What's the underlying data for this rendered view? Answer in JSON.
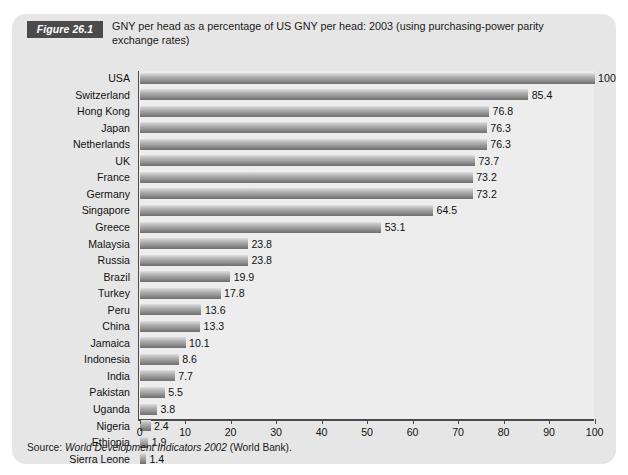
{
  "figure": {
    "tag": "Figure 26.1",
    "title": "GNY per head as  a percentage of US GNY per head: 2003 (using purchasing-power parity exchange rates)",
    "source_prefix": "Source: ",
    "source_italic": "World Development Indicators 2002",
    "source_suffix": " (World Bank)."
  },
  "colors": {
    "panel_background": "#e6e6e6",
    "plot_background": "#ededed",
    "tag_background": "#4b4b4b",
    "tag_text": "#ffffff",
    "axis": "#4a4a4a",
    "bar_light": "#e2e2e2",
    "bar_dark": "#6f6f6f",
    "text": "#111111",
    "page_background": "#ffffff"
  },
  "chart_data": {
    "type": "bar",
    "orientation": "horizontal",
    "title": "GNY per head as  a percentage of US GNY per head: 2003 (using purchasing-power parity exchange rates)",
    "xlabel": "",
    "ylabel": "",
    "xlim": [
      0,
      100
    ],
    "xticks": [
      0,
      10,
      20,
      30,
      40,
      50,
      60,
      70,
      80,
      90,
      100
    ],
    "grid": false,
    "legend": "none",
    "value_labels": true,
    "categories": [
      "USA",
      "Switzerland",
      "Hong Kong",
      "Japan",
      "Netherlands",
      "UK",
      "France",
      "Germany",
      "Singapore",
      "Greece",
      "Malaysia",
      "Russia",
      "Brazil",
      "Turkey",
      "Peru",
      "China",
      "Jamaica",
      "Indonesia",
      "India",
      "Pakistan",
      "Uganda",
      "Nigeria",
      "Ethiopia",
      "Sierra Leone"
    ],
    "values": [
      100,
      85.4,
      76.8,
      76.3,
      76.3,
      73.7,
      73.2,
      73.2,
      64.5,
      53.1,
      23.8,
      23.8,
      19.9,
      17.8,
      13.6,
      13.3,
      10.1,
      8.6,
      7.7,
      5.5,
      3.8,
      2.4,
      1.9,
      1.4
    ],
    "value_label_texts": [
      "100",
      "85.4",
      "76.8",
      "76.3",
      "76.3",
      "73.7",
      "73.2",
      "73.2",
      "64.5",
      "53.1",
      "23.8",
      "23.8",
      "19.9",
      "17.8",
      "13.6",
      "13.3",
      "10.1",
      "8.6",
      "7.7",
      "5.5",
      "3.8",
      "2.4",
      "1.9",
      "1.4"
    ]
  }
}
